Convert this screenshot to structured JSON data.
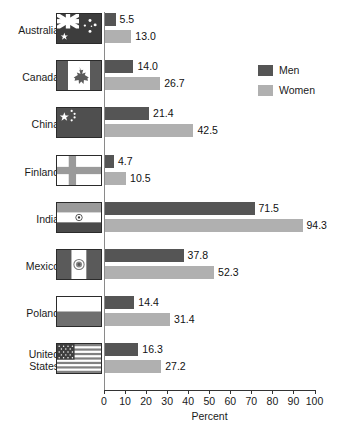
{
  "chart_data": {
    "type": "bar",
    "orientation": "horizontal",
    "title": "",
    "xlabel": "Percent",
    "ylabel": "",
    "xlim": [
      0,
      100
    ],
    "xticks": [
      0,
      10,
      20,
      30,
      40,
      50,
      60,
      70,
      80,
      90,
      100
    ],
    "grid": false,
    "legend_position": "top-right",
    "categories": [
      "Australia",
      "Canada",
      "China",
      "Finland",
      "India",
      "Mexico",
      "Poland",
      "United States"
    ],
    "series": [
      {
        "name": "Men",
        "color": "#555555",
        "values": [
          5.5,
          14.0,
          21.4,
          4.7,
          71.5,
          37.8,
          14.4,
          16.3
        ]
      },
      {
        "name": "Women",
        "color": "#b0b0b0",
        "values": [
          13.0,
          26.7,
          42.5,
          10.5,
          94.3,
          52.3,
          31.4,
          27.2
        ]
      }
    ],
    "value_labels": {
      "Australia": {
        "Men": "5.5",
        "Women": "13.0"
      },
      "Canada": {
        "Men": "14.0",
        "Women": "26.7"
      },
      "China": {
        "Men": "21.4",
        "Women": "42.5"
      },
      "Finland": {
        "Men": "4.7",
        "Women": "10.5"
      },
      "India": {
        "Men": "71.5",
        "Women": "94.3"
      },
      "Mexico": {
        "Men": "37.8",
        "Women": "52.3"
      },
      "Poland": {
        "Men": "14.4",
        "Women": "31.4"
      },
      "United States": {
        "Men": "16.3",
        "Women": "27.2"
      }
    }
  },
  "rows": [
    {
      "label_lines": [
        "Australia"
      ],
      "flag": "flag-australia",
      "men": "5.5",
      "women": "13.0"
    },
    {
      "label_lines": [
        "Canada"
      ],
      "flag": "flag-canada",
      "men": "14.0",
      "women": "26.7"
    },
    {
      "label_lines": [
        "China"
      ],
      "flag": "flag-china",
      "men": "21.4",
      "women": "42.5"
    },
    {
      "label_lines": [
        "Finland"
      ],
      "flag": "flag-finland",
      "men": "4.7",
      "women": "10.5"
    },
    {
      "label_lines": [
        "India"
      ],
      "flag": "flag-india",
      "men": "71.5",
      "women": "94.3"
    },
    {
      "label_lines": [
        "Mexico"
      ],
      "flag": "flag-mexico",
      "men": "37.8",
      "women": "52.3"
    },
    {
      "label_lines": [
        "Poland"
      ],
      "flag": "flag-poland",
      "men": "14.4",
      "women": "31.4"
    },
    {
      "label_lines": [
        "United",
        "States"
      ],
      "flag": "flag-united-states",
      "men": "16.3",
      "women": "27.2"
    }
  ],
  "axis": {
    "ticks": [
      "0",
      "10",
      "20",
      "30",
      "40",
      "50",
      "60",
      "70",
      "80",
      "90",
      "100"
    ],
    "xlabel": "Percent"
  },
  "legend": {
    "items": [
      {
        "label": "Men",
        "key": "men"
      },
      {
        "label": "Women",
        "key": "women"
      }
    ]
  },
  "colors": {
    "men": "#555555",
    "women": "#b0b0b0",
    "axis": "#333333",
    "text": "#1a1a1a"
  }
}
